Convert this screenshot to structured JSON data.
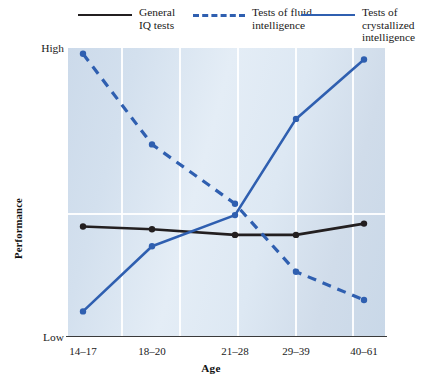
{
  "legend": {
    "items": [
      {
        "label": "General\nIQ tests",
        "style": "solid-black",
        "color": "#231f20",
        "name": "general-iq-tests"
      },
      {
        "label": "Tests of fluid\nintelligence",
        "style": "dashed-blue",
        "color": "#2f5fb0",
        "name": "tests-of-fluid-intelligence"
      },
      {
        "label": "Tests of crystallized\nintelligence",
        "style": "solid-blue",
        "color": "#2f5fb0",
        "name": "tests-of-crystallized-intelligence"
      }
    ]
  },
  "axes": {
    "y_title": "Performance",
    "y_high": "High",
    "y_low": "Low",
    "x_title": "Age"
  },
  "chart_data": {
    "type": "line",
    "title": "",
    "xlabel": "Age",
    "ylabel": "Performance",
    "categories": [
      "14–17",
      "18–20",
      "21–28",
      "29–39",
      "40–61"
    ],
    "ylim": [
      0,
      100
    ],
    "ytick_labels": [
      "Low",
      "High"
    ],
    "grid": "vertical gridlines between categories, one horizontal gridline at mid-upper level",
    "legend_position": "top",
    "series": [
      {
        "name": "General IQ tests",
        "color": "#231f20",
        "style": "solid",
        "values": [
          38,
          37,
          35,
          35,
          39
        ]
      },
      {
        "name": "Tests of fluid intelligence",
        "color": "#2f5fb0",
        "style": "dashed",
        "values": [
          99,
          67,
          46,
          22,
          12
        ]
      },
      {
        "name": "Tests of crystallized intelligence",
        "color": "#2f5fb0",
        "style": "solid",
        "values": [
          8,
          31,
          42,
          76,
          97
        ]
      }
    ]
  }
}
